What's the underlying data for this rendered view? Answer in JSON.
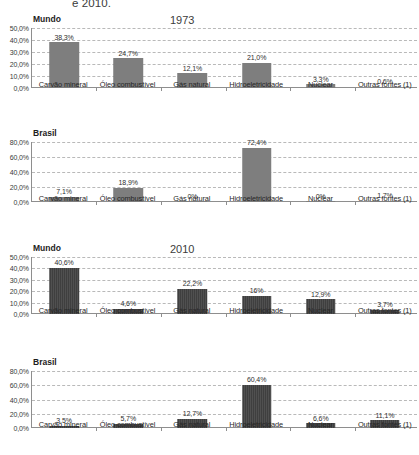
{
  "caption": {
    "text": "e 2010."
  },
  "chart_data": [
    {
      "type": "bar",
      "title": "1973",
      "region": "Mundo",
      "categories": [
        "Carvão mineral",
        "Óleo combustível",
        "Gás natural",
        "Hidroeletricidade",
        "Nuclear",
        "Outras fontes (1)"
      ],
      "values": [
        38.3,
        24.7,
        12.1,
        21.0,
        3.3,
        0.6
      ],
      "labels": [
        "38,3%",
        "24,7%",
        "12,1%",
        "21,0%",
        "3,3%",
        "0,6%"
      ],
      "ylim": [
        0,
        50
      ],
      "yticks": [
        0,
        10,
        20,
        30,
        40,
        50
      ],
      "ytick_labels": [
        "0,0%",
        "10,0%",
        "20,0%",
        "30,0%",
        "40,0%",
        "50,0%"
      ],
      "xlabel": "",
      "ylabel": "",
      "grid": true,
      "legend": "none",
      "bar_color": "#7e7e7e"
    },
    {
      "type": "bar",
      "title": "",
      "region": "Brasil",
      "categories": [
        "Carvão mineral",
        "Óleo combustível",
        "Gás natural",
        "Hidroeletricidade",
        "Nuclear",
        "Outras fontes (1)"
      ],
      "values": [
        7.1,
        18.9,
        0,
        72.4,
        0,
        1.7
      ],
      "labels": [
        "7,1%",
        "18,9%",
        "0%",
        "72,4%",
        "0%",
        "1,7%"
      ],
      "ylim": [
        0,
        80
      ],
      "yticks": [
        0,
        20,
        40,
        60,
        80
      ],
      "ytick_labels": [
        "0,0%",
        "20,0%",
        "40,0%",
        "60,0%",
        "80,0%"
      ],
      "xlabel": "",
      "ylabel": "",
      "grid": true,
      "legend": "none",
      "bar_color": "#7e7e7e"
    },
    {
      "type": "bar",
      "title": "2010",
      "region": "Mundo",
      "categories": [
        "Carvão mineral",
        "Óleo combustível",
        "Gás natural",
        "Hidroeletricidade",
        "Nuclear",
        "Outras fontes (1)"
      ],
      "values": [
        40.6,
        4.6,
        22.2,
        16.0,
        12.9,
        3.7
      ],
      "labels": [
        "40,6%",
        "4,6%",
        "22,2%",
        "16%",
        "12,9%",
        "3,7%"
      ],
      "ylim": [
        0,
        50
      ],
      "yticks": [
        0,
        10,
        20,
        30,
        40,
        50
      ],
      "ytick_labels": [
        "0,0%",
        "10,0%",
        "20,0%",
        "30,0%",
        "40,0%",
        "50,0%"
      ],
      "xlabel": "",
      "ylabel": "",
      "grid": true,
      "legend": "none",
      "bar_color": "#3f3f3f"
    },
    {
      "type": "bar",
      "title": "",
      "region": "Brasil",
      "categories": [
        "Carvão mineral",
        "Óleo combustível",
        "Gás natural",
        "Hidroeletricidade",
        "Nuclear",
        "Outras fontes (1)"
      ],
      "values": [
        3.5,
        5.7,
        12.7,
        60.4,
        6.6,
        11.1
      ],
      "labels": [
        "3,5%",
        "5,7%",
        "12,7%",
        "60,4%",
        "6,6%",
        "11,1%"
      ],
      "ylim": [
        0,
        80
      ],
      "yticks": [
        0,
        20,
        40,
        60,
        80
      ],
      "ytick_labels": [
        "0,0%",
        "20,0%",
        "40,0%",
        "60,0%",
        "80,0%"
      ],
      "xlabel": "",
      "ylabel": "",
      "grid": true,
      "legend": "none",
      "bar_color": "#3f3f3f"
    }
  ]
}
